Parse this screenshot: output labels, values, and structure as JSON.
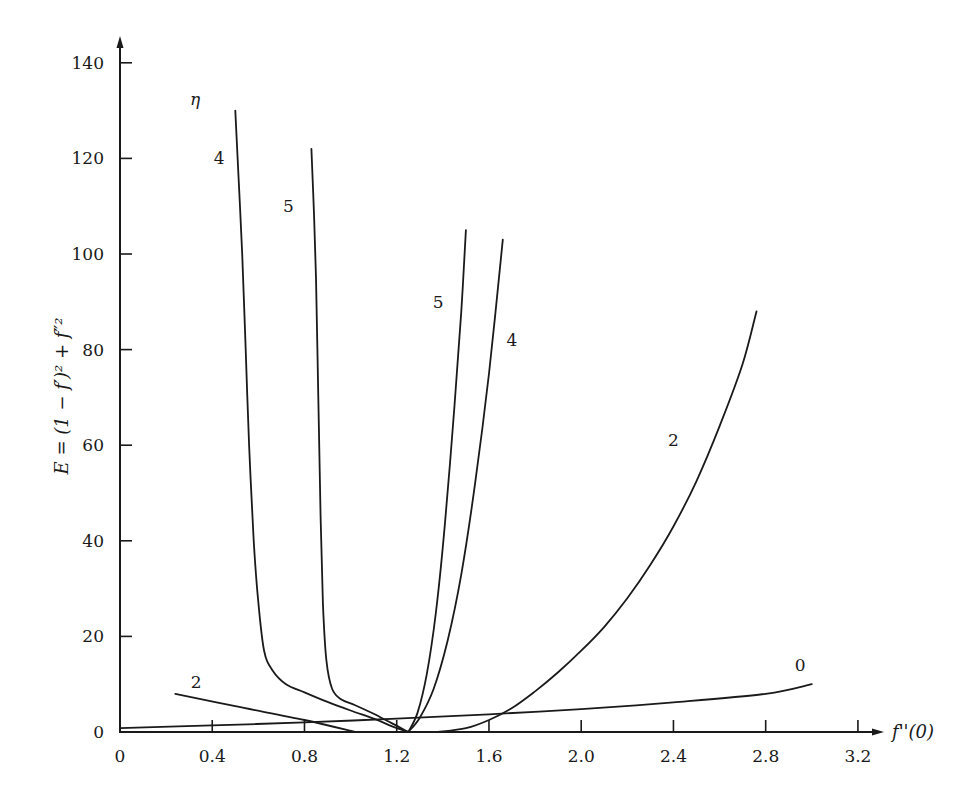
{
  "chart_data": {
    "type": "line",
    "title": "",
    "xlabel": "f''(0)",
    "ylabel": "E = (1 − f′)² + f″²",
    "xlim": [
      0,
      3.3
    ],
    "ylim": [
      0,
      145
    ],
    "grid": false,
    "legend": "none (curves labelled inline by η)",
    "legend_title": "η",
    "x_ticks": [
      "0",
      "0.4",
      "0.8",
      "1.2",
      "1.6",
      "2.0",
      "2.4",
      "2.8",
      "3.2"
    ],
    "x_tick_values": [
      0,
      0.4,
      0.8,
      1.2,
      1.6,
      2.0,
      2.4,
      2.8,
      3.2
    ],
    "y_ticks": [
      "0",
      "20",
      "40",
      "60",
      "80",
      "100",
      "120",
      "140"
    ],
    "y_tick_values": [
      0,
      20,
      40,
      60,
      80,
      100,
      120,
      140
    ],
    "series": [
      {
        "name": "0",
        "label_at": [
          2.95,
          14
        ],
        "points": [
          [
            0,
            0.8
          ],
          [
            0.4,
            1.4
          ],
          [
            0.8,
            2.0
          ],
          [
            1.2,
            2.8
          ],
          [
            1.6,
            3.7
          ],
          [
            2.0,
            4.8
          ],
          [
            2.4,
            6.2
          ],
          [
            2.8,
            8.0
          ],
          [
            3.0,
            10.0
          ]
        ]
      },
      {
        "name": "2",
        "label_at": [
          0.33,
          10.5
        ],
        "points": [
          [
            0.24,
            8.0
          ],
          [
            0.5,
            5.4
          ],
          [
            0.8,
            2.5
          ],
          [
            1.02,
            0.0
          ]
        ]
      },
      {
        "name": "2",
        "label_at": [
          2.4,
          61
        ],
        "points": [
          [
            1.38,
            0.0
          ],
          [
            1.5,
            0.8
          ],
          [
            1.6,
            2.5
          ],
          [
            1.7,
            5
          ],
          [
            1.8,
            8.5
          ],
          [
            1.9,
            12.5
          ],
          [
            2.0,
            17
          ],
          [
            2.1,
            22
          ],
          [
            2.2,
            28
          ],
          [
            2.3,
            35
          ],
          [
            2.4,
            43
          ],
          [
            2.5,
            52.5
          ],
          [
            2.6,
            64
          ],
          [
            2.7,
            77
          ],
          [
            2.76,
            88
          ]
        ]
      },
      {
        "name": "4",
        "label_at": [
          0.43,
          120
        ],
        "points": [
          [
            0.5,
            130
          ],
          [
            0.515,
            115
          ],
          [
            0.53,
            100
          ],
          [
            0.545,
            80
          ],
          [
            0.56,
            60
          ],
          [
            0.58,
            40
          ],
          [
            0.6,
            27
          ],
          [
            0.625,
            17
          ],
          [
            0.66,
            13
          ],
          [
            0.72,
            10
          ],
          [
            0.8,
            8.3
          ],
          [
            0.9,
            6.3
          ],
          [
            1.0,
            4.5
          ],
          [
            1.1,
            2.8
          ],
          [
            1.18,
            1.2
          ],
          [
            1.25,
            0.0
          ]
        ]
      },
      {
        "name": "5",
        "label_at": [
          0.73,
          110
        ],
        "points": [
          [
            0.83,
            122
          ],
          [
            0.84,
            110
          ],
          [
            0.85,
            95
          ],
          [
            0.86,
            70
          ],
          [
            0.87,
            45
          ],
          [
            0.88,
            27
          ],
          [
            0.895,
            15
          ],
          [
            0.92,
            9
          ],
          [
            0.96,
            6.8
          ],
          [
            1.02,
            5.6
          ],
          [
            1.1,
            3.8
          ],
          [
            1.18,
            1.8
          ],
          [
            1.25,
            0.0
          ]
        ]
      },
      {
        "name": "5",
        "label_at": [
          1.38,
          90
        ],
        "points": [
          [
            1.25,
            0.0
          ],
          [
            1.29,
            4
          ],
          [
            1.33,
            12
          ],
          [
            1.37,
            25
          ],
          [
            1.41,
            44
          ],
          [
            1.45,
            68
          ],
          [
            1.48,
            88
          ],
          [
            1.5,
            105
          ]
        ]
      },
      {
        "name": "4",
        "label_at": [
          1.7,
          82
        ],
        "points": [
          [
            1.25,
            0.0
          ],
          [
            1.3,
            3
          ],
          [
            1.36,
            9
          ],
          [
            1.42,
            19
          ],
          [
            1.48,
            33
          ],
          [
            1.54,
            52
          ],
          [
            1.6,
            75
          ],
          [
            1.66,
            103
          ]
        ]
      }
    ]
  }
}
